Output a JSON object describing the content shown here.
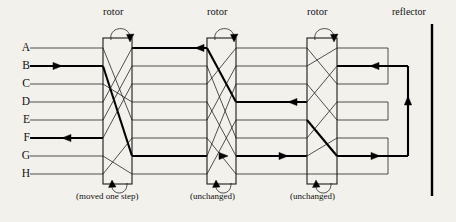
{
  "diagram": {
    "title_hidden": "Enigma machine rotor signal path",
    "background_color": "#f3f1ec",
    "line_color": "#1a1a1a",
    "bold_color": "#000000"
  },
  "rows": [
    {
      "label": "A",
      "y": 48
    },
    {
      "label": "B",
      "y": 66
    },
    {
      "label": "C",
      "y": 84
    },
    {
      "label": "D",
      "y": 102
    },
    {
      "label": "E",
      "y": 120
    },
    {
      "label": "F",
      "y": 138
    },
    {
      "label": "G",
      "y": 156
    },
    {
      "label": "H",
      "y": 174
    }
  ],
  "rotors": [
    {
      "id": "rotor-1",
      "label": "rotor",
      "caption": "(moved one step)",
      "x_left": 103,
      "x_right": 132,
      "label_x": 103,
      "label_y": 14,
      "caption_x": 78,
      "caption_y": 197,
      "wiring": [
        {
          "from": 0,
          "to": 4,
          "bold": false
        },
        {
          "from": 1,
          "to": 6,
          "bold": true
        },
        {
          "from": 2,
          "to": 3,
          "bold": false
        },
        {
          "from": 3,
          "to": 0,
          "bold": false
        },
        {
          "from": 4,
          "to": 1,
          "bold": false
        },
        {
          "from": 5,
          "to": 2,
          "bold": false
        },
        {
          "from": 6,
          "to": 7,
          "bold": false
        },
        {
          "from": 7,
          "to": 5,
          "bold": false
        }
      ]
    },
    {
      "id": "rotor-2",
      "label": "rotor",
      "caption": "(unchanged)",
      "x_left": 207,
      "x_right": 236,
      "label_x": 207,
      "label_y": 14,
      "caption_x": 188,
      "caption_y": 197,
      "wiring": [
        {
          "from": 0,
          "to": 3,
          "bold": true
        },
        {
          "from": 1,
          "to": 5,
          "bold": false
        },
        {
          "from": 2,
          "to": 0,
          "bold": false
        },
        {
          "from": 3,
          "to": 6,
          "bold": false
        },
        {
          "from": 4,
          "to": 1,
          "bold": false
        },
        {
          "from": 5,
          "to": 7,
          "bold": false
        },
        {
          "from": 6,
          "to": 2,
          "bold": false
        },
        {
          "from": 7,
          "to": 4,
          "bold": false
        }
      ]
    },
    {
      "id": "rotor-3",
      "label": "rotor",
      "caption": "(unchanged)",
      "x_left": 307,
      "x_right": 337,
      "label_x": 307,
      "label_y": 14,
      "caption_x": 288,
      "caption_y": 197,
      "wiring": [
        {
          "from": 0,
          "to": 2,
          "bold": false
        },
        {
          "from": 1,
          "to": 0,
          "bold": false
        },
        {
          "from": 2,
          "to": 4,
          "bold": false
        },
        {
          "from": 3,
          "to": 1,
          "bold": false
        },
        {
          "from": 4,
          "to": 6,
          "bold": true
        },
        {
          "from": 5,
          "to": 3,
          "bold": false
        },
        {
          "from": 6,
          "to": 5,
          "bold": false
        },
        {
          "from": 7,
          "to": 7,
          "bold": false
        }
      ]
    }
  ],
  "reflector": {
    "label": "reflector",
    "label_x": 392,
    "label_y": 14,
    "bar_x": 432,
    "bar_top": 24,
    "bar_bottom": 196,
    "pairs": [
      {
        "rows": [
          0,
          2
        ],
        "depth": 388,
        "bold": false
      },
      {
        "rows": [
          1,
          6
        ],
        "depth": 408,
        "bold": true
      },
      {
        "rows": [
          3,
          4
        ],
        "depth": 388,
        "bold": false
      },
      {
        "rows": [
          5,
          7
        ],
        "depth": 388,
        "bold": false
      }
    ]
  },
  "signal_path": {
    "input_row": "B",
    "output_row": "F",
    "input_arrow_x": 62,
    "output_arrow_x": 62,
    "segments_bold": true
  },
  "wire_start_x": 30,
  "wire_end_x": 432
}
